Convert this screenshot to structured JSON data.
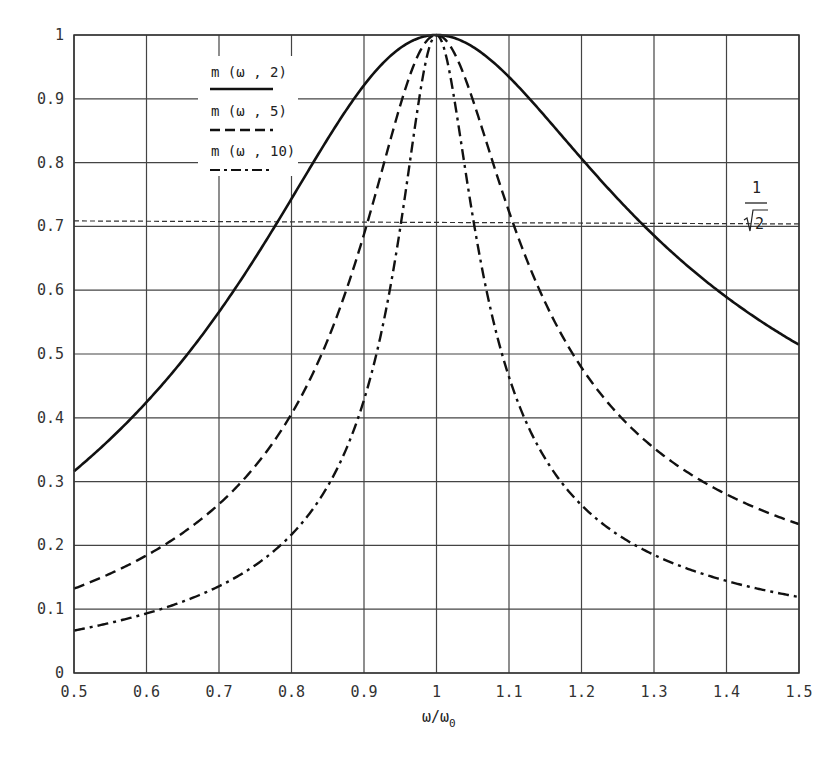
{
  "chart_data": {
    "type": "line",
    "title": "",
    "xlabel": "ω/ω0",
    "ylabel": "",
    "xlim": [
      0.5,
      1.5
    ],
    "ylim": [
      0,
      1
    ],
    "grid": true,
    "legend_position": "upper-left (inside plot, near x=0.7-0.8)",
    "x_ticks": [
      "0.5",
      "0.6",
      "0.7",
      "0.8",
      "0.9",
      "1",
      "1.1",
      "1.2",
      "1.3",
      "1.4",
      "1.5"
    ],
    "y_ticks": [
      "0",
      "0.1",
      "0.2",
      "0.3",
      "0.4",
      "0.5",
      "0.6",
      "0.7",
      "0.8",
      "0.9",
      "1"
    ],
    "x": [
      0.5,
      0.6,
      0.7,
      0.8,
      0.9,
      1.0,
      1.1,
      1.2,
      1.3,
      1.4,
      1.5
    ],
    "series": [
      {
        "name": "m(ω,2)",
        "Q": 2,
        "style": "solid",
        "values": [
          0.316,
          0.428,
          0.563,
          0.728,
          0.901,
          1.0,
          0.922,
          0.801,
          0.685,
          0.589,
          0.514
        ]
      },
      {
        "name": "m(ω,5)",
        "Q": 5,
        "style": "dashed",
        "values": [
          0.132,
          0.188,
          0.281,
          0.424,
          0.647,
          1.0,
          0.696,
          0.479,
          0.351,
          0.277,
          0.233
        ]
      },
      {
        "name": "m(ω,10)",
        "Q": 10,
        "style": "dash-dot",
        "values": [
          0.067,
          0.095,
          0.143,
          0.219,
          0.394,
          1.0,
          0.464,
          0.265,
          0.183,
          0.142,
          0.119
        ]
      }
    ],
    "reference_line": {
      "label": "1/√2",
      "value": 0.707,
      "style": "dotted"
    },
    "annotations": [
      {
        "text": "1/√2",
        "position": "right, near y=0.707"
      }
    ]
  },
  "legend": {
    "items": [
      {
        "label": "m (ω , 2)"
      },
      {
        "label": "m (ω , 5)"
      },
      {
        "label": "m (ω , 10)"
      }
    ]
  },
  "axis": {
    "x_label_main": "ω/ω",
    "x_label_sub": "0"
  },
  "annotation": {
    "numerator": "1",
    "radicand": "2"
  },
  "colors": {
    "line": "#111111",
    "grid": "#444444",
    "background": "#ffffff"
  }
}
